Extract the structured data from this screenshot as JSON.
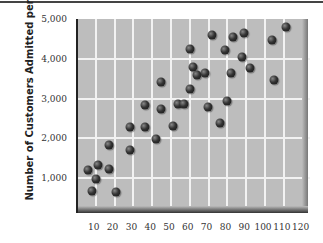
{
  "chart_data": {
    "type": "scatter",
    "title": "",
    "xlabel": "",
    "ylabel": "Number of Customers  Admitted per Day",
    "xlim": [
      0,
      122
    ],
    "ylim": [
      170,
      5000
    ],
    "grid": true,
    "legend": null,
    "x_ticks": [
      10,
      20,
      30,
      40,
      50,
      60,
      70,
      80,
      90,
      100,
      110,
      120
    ],
    "x_tick_labels": [
      "10",
      "20",
      "30",
      "40",
      "50",
      "60",
      "70",
      "80",
      "90",
      "100",
      "110",
      "120"
    ],
    "y_ticks": [
      1000,
      2000,
      3000,
      4000,
      5000
    ],
    "y_tick_labels": [
      "1,000",
      "2,000",
      "3,000",
      "4,000",
      "5,000"
    ],
    "points": [
      {
        "x": 7,
        "y": 1200
      },
      {
        "x": 12,
        "y": 1330
      },
      {
        "x": 18,
        "y": 1230
      },
      {
        "x": 11,
        "y": 980
      },
      {
        "x": 9,
        "y": 670
      },
      {
        "x": 22,
        "y": 650
      },
      {
        "x": 18,
        "y": 1830
      },
      {
        "x": 29,
        "y": 1700
      },
      {
        "x": 29,
        "y": 2280
      },
      {
        "x": 37,
        "y": 2280
      },
      {
        "x": 43,
        "y": 1980
      },
      {
        "x": 37,
        "y": 2840
      },
      {
        "x": 46,
        "y": 2740
      },
      {
        "x": 46,
        "y": 3420
      },
      {
        "x": 52,
        "y": 2310
      },
      {
        "x": 55,
        "y": 2860
      },
      {
        "x": 58,
        "y": 2860
      },
      {
        "x": 61,
        "y": 4250
      },
      {
        "x": 61,
        "y": 3240
      },
      {
        "x": 63,
        "y": 3790
      },
      {
        "x": 65,
        "y": 3590
      },
      {
        "x": 69,
        "y": 3640
      },
      {
        "x": 71,
        "y": 2790
      },
      {
        "x": 73,
        "y": 4600
      },
      {
        "x": 77,
        "y": 2380
      },
      {
        "x": 80,
        "y": 4220
      },
      {
        "x": 81,
        "y": 2940
      },
      {
        "x": 83,
        "y": 3640
      },
      {
        "x": 84,
        "y": 4550
      },
      {
        "x": 89,
        "y": 4040
      },
      {
        "x": 90,
        "y": 4650
      },
      {
        "x": 93,
        "y": 3770
      },
      {
        "x": 105,
        "y": 4470
      },
      {
        "x": 106,
        "y": 3470
      },
      {
        "x": 112,
        "y": 4800
      }
    ]
  },
  "colors": {
    "plot_background": "#bdbdbd",
    "gridline": "#f2f2f2",
    "dot": "#222222"
  }
}
